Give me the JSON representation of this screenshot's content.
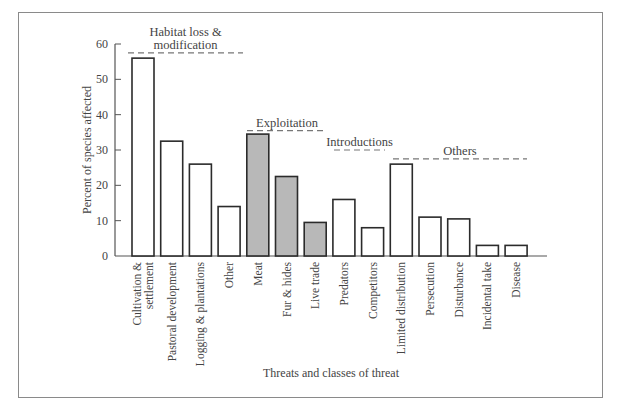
{
  "chart_data": {
    "type": "bar",
    "title": "",
    "xlabel": "Threats and classes of threat",
    "ylabel": "Percent of species affected",
    "ylim": [
      0,
      60
    ],
    "yticks": [
      0,
      10,
      20,
      30,
      40,
      50,
      60
    ],
    "grid": false,
    "categories": [
      [
        "Cultivation &",
        "settlement"
      ],
      [
        "Pastoral development"
      ],
      [
        "Logging & plantations"
      ],
      [
        "Other"
      ],
      [
        "Meat"
      ],
      [
        "Fur & hides"
      ],
      [
        "Live trade"
      ],
      [
        "Predators"
      ],
      [
        "Competitors"
      ],
      [
        "Limited distribution"
      ],
      [
        "Persecution"
      ],
      [
        "Disturbance"
      ],
      [
        "Incidental take"
      ],
      [
        "Disease"
      ]
    ],
    "values": [
      56,
      32.5,
      26,
      14,
      34.5,
      22.5,
      9.5,
      16,
      8,
      26,
      11,
      10.5,
      3,
      3
    ],
    "groups": [
      {
        "name": [
          "Habitat loss &",
          "modification"
        ],
        "start": 0,
        "end": 3,
        "line_y": 57.5,
        "fill": "#ffffff"
      },
      {
        "name": [
          "Exploitation"
        ],
        "start": 4,
        "end": 6,
        "line_y": 35.5,
        "fill": "#b8b8b8"
      },
      {
        "name": [
          "Introductions"
        ],
        "start": 7,
        "end": 8,
        "line_y": 30,
        "fill": "#ffffff"
      },
      {
        "name": [
          "Others"
        ],
        "start": 9,
        "end": 13,
        "line_y": 27.5,
        "fill": "#ffffff"
      }
    ],
    "colors": {
      "bar_stroke": "#2b2b2b",
      "shaded_fill": "#b8b8b8",
      "plain_fill": "#ffffff",
      "axis": "#555555",
      "dash": "#777777"
    },
    "legend": "none"
  }
}
